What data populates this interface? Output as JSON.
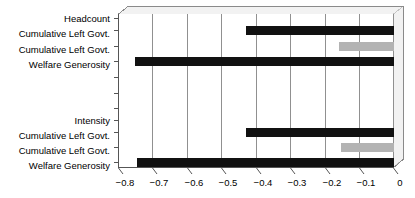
{
  "chart_data": {
    "type": "bar",
    "orientation": "horizontal",
    "title": "",
    "subtitle": "",
    "xlabel": "",
    "ylabel": "",
    "xlim": [
      -0.8,
      0.0
    ],
    "grid": true,
    "legend": false,
    "legend_position": "none",
    "xticks": [
      -0.8,
      -0.7,
      -0.6,
      -0.5,
      -0.4,
      -0.3,
      -0.2,
      -0.1,
      0
    ],
    "xtick_labels": [
      "−0.8",
      "−0.7",
      "−0.6",
      "−0.5",
      "−0.4",
      "−0.3",
      "−0.2",
      "−0.1",
      "0"
    ],
    "groups": [
      {
        "name": "Headcount",
        "header_label": "Headcount",
        "rows": [
          {
            "label": "Headcount",
            "value": null,
            "color": "",
            "is_header": true
          },
          {
            "label": "Cumulative Left Govt.",
            "value": -0.43,
            "color": "#111111",
            "is_header": false
          },
          {
            "label": "Cumulative Left Govt.",
            "value": -0.16,
            "color": "#b3b3b3",
            "is_header": false
          },
          {
            "label": "Welfare Generosity",
            "value": -0.75,
            "color": "#111111",
            "is_header": false
          }
        ]
      },
      {
        "name": "Intensity",
        "header_label": "Intensity",
        "rows": [
          {
            "label": "Intensity",
            "value": null,
            "color": "",
            "is_header": true
          },
          {
            "label": "Cumulative Left Govt.",
            "value": -0.43,
            "color": "#111111",
            "is_header": false
          },
          {
            "label": "Cumulative Left Govt.",
            "value": -0.155,
            "color": "#b3b3b3",
            "is_header": false
          },
          {
            "label": "Welfare Generosity",
            "value": -0.745,
            "color": "#111111",
            "is_header": false
          }
        ]
      }
    ],
    "categories": [
      "Headcount",
      "Cumulative Left Govt.",
      "Cumulative Left Govt.",
      "Welfare Generosity",
      "Intensity",
      "Cumulative Left Govt.",
      "Cumulative Left Govt.",
      "Welfare Generosity"
    ],
    "values": [
      null,
      -0.43,
      -0.16,
      -0.75,
      null,
      -0.43,
      -0.155,
      -0.745
    ],
    "colors": [
      "",
      "#111111",
      "#b3b3b3",
      "#111111",
      "",
      "#111111",
      "#b3b3b3",
      "#111111"
    ]
  },
  "labels": {
    "row0": "Headcount",
    "row1": "Cumulative Left Govt.",
    "row2": "Cumulative Left Govt.",
    "row3": "Welfare Generosity",
    "row4": "Intensity",
    "row5": "Cumulative Left Govt.",
    "row6": "Cumulative Left Govt.",
    "row7": "Welfare Generosity"
  },
  "ticks": {
    "t0": "−0.8",
    "t1": "−0.7",
    "t2": "−0.6",
    "t3": "−0.5",
    "t4": "−0.4",
    "t5": "−0.3",
    "t6": "−0.2",
    "t7": "−0.1",
    "t8": "0"
  },
  "colors": {
    "bar_dark": "#111111",
    "bar_light": "#b3b3b3",
    "grid": "#909090",
    "frame": "#8a8a8a",
    "background": "#ffffff"
  }
}
